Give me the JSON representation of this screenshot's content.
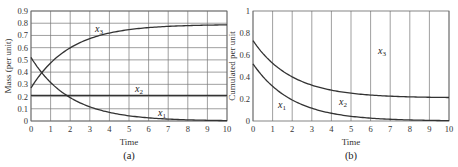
{
  "chart_data": [
    {
      "type": "line",
      "panel_label": "(a)",
      "title": "",
      "xlabel": "Time",
      "ylabel": "Mass (per unit)",
      "xlim": [
        0,
        10
      ],
      "ylim": [
        0,
        0.9
      ],
      "xticks": [
        0,
        1,
        2,
        3,
        4,
        5,
        6,
        7,
        8,
        9,
        10
      ],
      "yticks": [
        0,
        0.1,
        0.2,
        0.3,
        0.4,
        0.5,
        0.6,
        0.7,
        0.8,
        0.9
      ],
      "grid": "both",
      "x": [
        0,
        1,
        2,
        3,
        4,
        5,
        6,
        7,
        8,
        9,
        10
      ],
      "series": [
        {
          "name": "x1",
          "values": [
            0.52,
            0.32,
            0.19,
            0.12,
            0.07,
            0.04,
            0.03,
            0.02,
            0.01,
            0.01,
            0.0
          ]
        },
        {
          "name": "x2",
          "values": [
            0.21,
            0.21,
            0.21,
            0.21,
            0.21,
            0.21,
            0.21,
            0.21,
            0.21,
            0.21,
            0.21
          ]
        },
        {
          "name": "x3",
          "values": [
            0.27,
            0.47,
            0.6,
            0.67,
            0.72,
            0.75,
            0.76,
            0.77,
            0.78,
            0.78,
            0.79
          ]
        }
      ]
    },
    {
      "type": "area",
      "panel_label": "(b)",
      "title": "",
      "xlabel": "Time",
      "ylabel": "Cumulated per unit",
      "xlim": [
        0,
        10
      ],
      "ylim": [
        0,
        1
      ],
      "xticks": [
        0,
        1,
        2,
        3,
        4,
        5,
        6,
        7,
        8,
        9,
        10
      ],
      "yticks": [
        0,
        0.2,
        0.4,
        0.6,
        0.8,
        1
      ],
      "grid": "vertical",
      "stacked": true,
      "x": [
        0,
        1,
        2,
        3,
        4,
        5,
        6,
        7,
        8,
        9,
        10
      ],
      "series": [
        {
          "name": "x1",
          "values": [
            0.52,
            0.32,
            0.19,
            0.12,
            0.07,
            0.04,
            0.03,
            0.02,
            0.01,
            0.01,
            0.0
          ]
        },
        {
          "name": "x2",
          "values": [
            0.21,
            0.21,
            0.21,
            0.21,
            0.21,
            0.21,
            0.21,
            0.21,
            0.21,
            0.21,
            0.21
          ]
        },
        {
          "name": "x3",
          "values": [
            0.27,
            0.47,
            0.6,
            0.67,
            0.72,
            0.75,
            0.76,
            0.77,
            0.78,
            0.78,
            0.79
          ]
        }
      ],
      "boundaries": {
        "x1_top": [
          0.52,
          0.32,
          0.19,
          0.12,
          0.07,
          0.04,
          0.03,
          0.02,
          0.01,
          0.01,
          0.0
        ],
        "x1_plus_x2_top": [
          0.73,
          0.53,
          0.4,
          0.33,
          0.28,
          0.25,
          0.24,
          0.23,
          0.22,
          0.22,
          0.21
        ]
      }
    }
  ],
  "labels": {
    "a": {
      "ylabel": "Mass (per unit)",
      "xlabel": "Time",
      "panel": "(a)",
      "curves": [
        "x",
        "x",
        "x"
      ],
      "subs": [
        "1",
        "2",
        "3"
      ]
    },
    "b": {
      "ylabel": "Cumulated per unit",
      "xlabel": "Time",
      "panel": "(b)",
      "subs": [
        "1",
        "2",
        "3"
      ]
    }
  }
}
